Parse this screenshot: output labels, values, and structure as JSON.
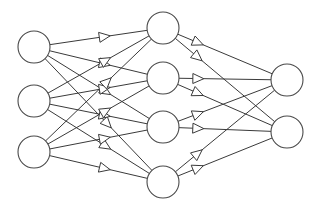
{
  "diagram": {
    "type": "feedforward-neural-network",
    "background": "#ffffff",
    "stroke_color": "#3a3a3a",
    "node_radius": 16,
    "arrow_style": "hollow-triangle",
    "layers": [
      {
        "name": "input",
        "arrow_fraction": 0.62,
        "nodes": [
          {
            "id": "i1",
            "cx": 34,
            "cy": 47
          },
          {
            "id": "i2",
            "cx": 34,
            "cy": 101
          },
          {
            "id": "i3",
            "cx": 34,
            "cy": 152
          }
        ]
      },
      {
        "name": "hidden",
        "arrow_fraction": 0.27,
        "nodes": [
          {
            "id": "h1",
            "cx": 163,
            "cy": 28
          },
          {
            "id": "h2",
            "cx": 163,
            "cy": 78
          },
          {
            "id": "h3",
            "cx": 163,
            "cy": 127
          },
          {
            "id": "h4",
            "cx": 163,
            "cy": 182
          }
        ]
      },
      {
        "name": "output",
        "nodes": [
          {
            "id": "o1",
            "cx": 287,
            "cy": 80
          },
          {
            "id": "o2",
            "cx": 287,
            "cy": 132
          }
        ]
      }
    ],
    "connectivity": "fully-connected-between-adjacent-layers"
  }
}
